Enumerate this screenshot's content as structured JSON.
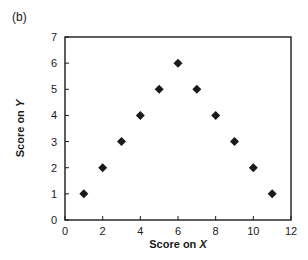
{
  "panel_label": "(b)",
  "chart_data": {
    "type": "scatter",
    "title": "",
    "xlabel": "Score on X",
    "ylabel": "Score on Y",
    "xlim": [
      0,
      12
    ],
    "ylim": [
      0,
      7
    ],
    "xticks": [
      0,
      2,
      4,
      6,
      8,
      10,
      12
    ],
    "yticks": [
      0,
      1,
      2,
      3,
      4,
      5,
      6,
      7
    ],
    "grid": false,
    "legend": null,
    "marker": "diamond",
    "series": [
      {
        "name": "scores",
        "x": [
          1,
          2,
          3,
          4,
          5,
          6,
          7,
          8,
          9,
          10,
          11
        ],
        "y": [
          1,
          2,
          3,
          4,
          5,
          6,
          5,
          4,
          3,
          2,
          1
        ]
      }
    ]
  }
}
